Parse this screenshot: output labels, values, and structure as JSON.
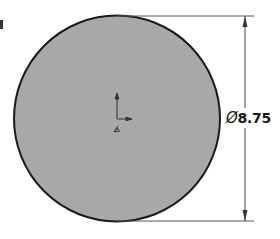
{
  "drawing": {
    "shape": "circle",
    "fill_color": "#a8a8a8",
    "outline_color": "#1a1a1a",
    "dimension": {
      "symbol": "Ø",
      "value": "8.75",
      "type": "diameter"
    },
    "origin_marker": {
      "icon": "coordinate-origin-icon",
      "label": "origin axes"
    }
  }
}
